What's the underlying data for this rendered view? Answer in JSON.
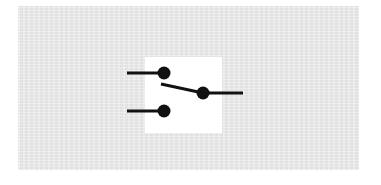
{
  "diagram": {
    "type": "electrical-schematic",
    "symbol": "SPDT switch (single pole double throw)",
    "colors": {
      "background_panel": "#ebebeb",
      "symbol_background": "#ffffff",
      "stroke": "#111111"
    },
    "terminals": [
      {
        "name": "throw-1-top",
        "cx": 164,
        "cy": 73
      },
      {
        "name": "throw-2-bottom",
        "cx": 164,
        "cy": 111
      },
      {
        "name": "common-pole",
        "cx": 203,
        "cy": 93
      }
    ],
    "leads": [
      {
        "name": "top-input-lead",
        "x1": 127,
        "y1": 73,
        "x2": 164,
        "y2": 73
      },
      {
        "name": "bottom-input-lead",
        "x1": 127,
        "y1": 111,
        "x2": 164,
        "y2": 111
      },
      {
        "name": "output-lead",
        "x1": 203,
        "y1": 93,
        "x2": 243,
        "y2": 93
      }
    ],
    "lever": {
      "x1": 161,
      "y1": 84,
      "x2": 203,
      "y2": 93
    }
  }
}
